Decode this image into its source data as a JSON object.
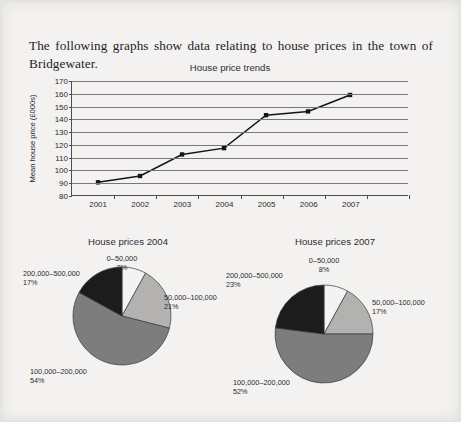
{
  "intro_text": "The following graphs show data relating to house prices in the town of Bridgewater.",
  "chart_data": [
    {
      "type": "line",
      "title": "House price trends",
      "xlabel": "",
      "ylabel": "Mean house price (£000s)",
      "categories": [
        "2001",
        "2002",
        "2003",
        "2004",
        "2005",
        "2006",
        "2007"
      ],
      "values": [
        90,
        95,
        112,
        117,
        143,
        146,
        159
      ],
      "ylim": [
        80,
        170
      ],
      "ytick_step": 10,
      "yticks": [
        "80",
        "90",
        "100",
        "110",
        "120",
        "130",
        "140",
        "150",
        "160",
        "170"
      ],
      "grid": true,
      "legend": "none",
      "marker": "square",
      "series_color": "#151515"
    },
    {
      "type": "pie",
      "title": "House prices 2004",
      "labels": [
        "0–50,000",
        "50,000–100,000",
        "100,000–200,000",
        "200,000–500,000"
      ],
      "values": [
        8,
        21,
        54,
        17
      ],
      "value_labels": [
        "8%",
        "21%",
        "54%",
        "17%"
      ],
      "colors": [
        "#f4f3f1",
        "#b3b2b1",
        "#7e7d7d",
        "#1c1c1c"
      ],
      "legend": "labels-outside"
    },
    {
      "type": "pie",
      "title": "House prices 2007",
      "labels": [
        "0–50,000",
        "50,000–100,000",
        "100,000–200,000",
        "200,000–500,000"
      ],
      "values": [
        8,
        17,
        52,
        23
      ],
      "value_labels": [
        "8%",
        "17%",
        "52%",
        "23%"
      ],
      "colors": [
        "#f4f3f1",
        "#b3b2b1",
        "#7e7d7d",
        "#1c1c1c"
      ],
      "legend": "labels-outside"
    }
  ],
  "pie_2004_labels": [
    {
      "name": "0–50,000",
      "pct": "8%"
    },
    {
      "name": "50,000–100,000",
      "pct": "21%"
    },
    {
      "name": "100,000–200,000",
      "pct": "54%"
    },
    {
      "name": "200,000–500,000",
      "pct": "17%"
    }
  ],
  "pie_2007_labels": [
    {
      "name": "0–50,000",
      "pct": "8%"
    },
    {
      "name": "50,000–100,000",
      "pct": "17%"
    },
    {
      "name": "100,000–200,000",
      "pct": "52%"
    },
    {
      "name": "200,000–500,000",
      "pct": "23%"
    }
  ]
}
